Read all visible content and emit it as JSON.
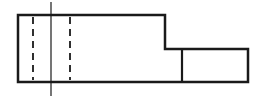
{
  "diagram": {
    "type": "orthographic-view",
    "width": 264,
    "height": 100,
    "background": "#ffffff",
    "stroke_color": "#1a1a1a",
    "outline": {
      "points": [
        [
          18,
          15
        ],
        [
          165,
          15
        ],
        [
          165,
          49
        ],
        [
          248,
          49
        ],
        [
          248,
          82
        ],
        [
          18,
          82
        ]
      ],
      "stroke_width": 2.5
    },
    "partition_line": {
      "x1": 182,
      "y1": 49,
      "x2": 182,
      "y2": 82,
      "stroke_width": 2.2
    },
    "hidden_lines": [
      {
        "x1": 33,
        "y1": 17,
        "x2": 33,
        "y2": 80,
        "dash": "7,5",
        "stroke_width": 1.8
      },
      {
        "x1": 70,
        "y1": 17,
        "x2": 70,
        "y2": 80,
        "dash": "7,5",
        "stroke_width": 1.8
      }
    ],
    "center_line": {
      "x1": 51,
      "y1": 2,
      "x2": 51,
      "y2": 96,
      "stroke_width": 1.2
    }
  }
}
